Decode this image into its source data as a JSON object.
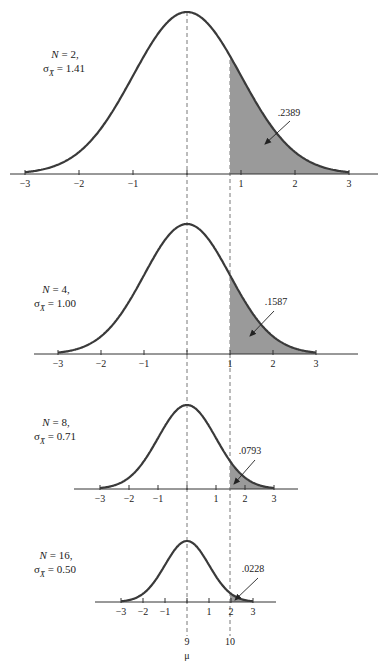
{
  "chart_data": [
    {
      "type": "area",
      "title": "Sampling distribution of the mean, N = 2",
      "params": {
        "n_label": "N = 2,",
        "sigma_symbol": "σ",
        "sigma_sub": "X̄",
        "sigma_value": "= 1.41"
      },
      "N": 2,
      "sigma_xbar": 1.41,
      "x_ticks": [
        -3,
        -2,
        -1,
        0,
        1,
        2,
        3
      ],
      "x_tick_labels": [
        "−3",
        "−2",
        "−1",
        "",
        "1",
        "2",
        "3"
      ],
      "xlim": [
        -3,
        3
      ],
      "shaded_from_z": 0.71,
      "shaded_area": ".2389",
      "shaded_area_value": 0.2389
    },
    {
      "type": "area",
      "title": "Sampling distribution of the mean, N = 4",
      "params": {
        "n_label": "N = 4,",
        "sigma_symbol": "σ",
        "sigma_sub": "X̄",
        "sigma_value": "= 1.00"
      },
      "N": 4,
      "sigma_xbar": 1.0,
      "x_ticks": [
        -3,
        -2,
        -1,
        0,
        1,
        2,
        3
      ],
      "x_tick_labels": [
        "−3",
        "−2",
        "−1",
        "",
        "1",
        "2",
        "3"
      ],
      "xlim": [
        -3,
        3
      ],
      "shaded_from_z": 1.0,
      "shaded_area": ".1587",
      "shaded_area_value": 0.1587
    },
    {
      "type": "area",
      "title": "Sampling distribution of the mean, N = 8",
      "params": {
        "n_label": "N = 8,",
        "sigma_symbol": "σ",
        "sigma_sub": "X̄",
        "sigma_value": "= 0.71"
      },
      "N": 8,
      "sigma_xbar": 0.71,
      "x_ticks": [
        -3,
        -2,
        -1,
        0,
        1,
        2,
        3
      ],
      "x_tick_labels": [
        "−3",
        "−2",
        "−1",
        "",
        "1",
        "2",
        "3"
      ],
      "xlim": [
        -3,
        3
      ],
      "shaded_from_z": 1.41,
      "shaded_area": ".0793",
      "shaded_area_value": 0.0793
    },
    {
      "type": "area",
      "title": "Sampling distribution of the mean, N = 16",
      "params": {
        "n_label": "N = 16,",
        "sigma_symbol": "σ",
        "sigma_sub": "X̄",
        "sigma_value": "= 0.50"
      },
      "N": 16,
      "sigma_xbar": 0.5,
      "x_ticks": [
        -3,
        -2,
        -1,
        0,
        1,
        2,
        3
      ],
      "x_tick_labels": [
        "−3",
        "−2",
        "−1",
        "",
        "1",
        "2",
        "3"
      ],
      "xlim": [
        -3,
        3
      ],
      "shaded_from_z": 2.0,
      "shaded_area": ".0228",
      "shaded_area_value": 0.0228
    }
  ],
  "raw_scale": {
    "mean_label": "9",
    "cutoff_label": "10",
    "mu_label": "μ",
    "mean_value": 9,
    "cutoff_value": 10
  },
  "layout": {
    "center_x": 187,
    "cutoff_x": 230,
    "panels": [
      {
        "baseline": 174,
        "peak": 12,
        "unit": 54,
        "axis_left": 10,
        "axis_right": 378,
        "label_x": 65,
        "label_y": 58,
        "ann_x": 289,
        "ann_y": 116,
        "arrow": [
          290,
          121,
          265,
          144
        ]
      },
      {
        "baseline": 354,
        "peak": 224,
        "unit": 43,
        "axis_left": 34,
        "axis_right": 358,
        "label_x": 56,
        "label_y": 293,
        "ann_x": 276,
        "ann_y": 305,
        "arrow": [
          274,
          311,
          250,
          336
        ]
      },
      {
        "baseline": 489,
        "peak": 405,
        "unit": 29,
        "axis_left": 74,
        "axis_right": 298,
        "label_x": 56,
        "label_y": 426,
        "ann_x": 250,
        "ann_y": 454,
        "arrow": [
          255,
          460,
          234,
          484
        ]
      },
      {
        "baseline": 602,
        "peak": 541,
        "unit": 22,
        "axis_left": 95,
        "axis_right": 276,
        "label_x": 56,
        "label_y": 559,
        "ann_x": 253,
        "ann_y": 572,
        "arrow": [
          258,
          578,
          235,
          600
        ]
      }
    ]
  }
}
